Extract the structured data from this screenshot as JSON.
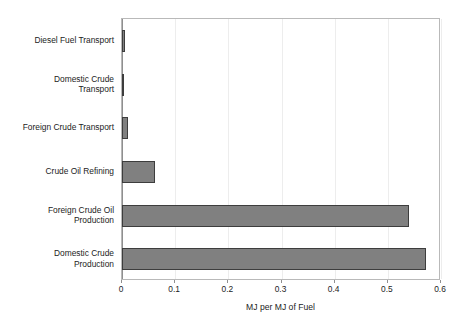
{
  "chart_data": {
    "type": "bar",
    "orientation": "horizontal",
    "title": "",
    "xlabel": "MJ per MJ of Fuel",
    "ylabel": "",
    "xlim": [
      0,
      0.6
    ],
    "xticks": [
      "0",
      "0.1",
      "0.2",
      "0.3",
      "0.4",
      "0.5",
      "0.6"
    ],
    "xtick_values": [
      0,
      0.1,
      0.2,
      0.3,
      0.4,
      0.5,
      0.6
    ],
    "grid": false,
    "legend": "none",
    "bar_color": "#808080",
    "bar_edge_color": "#3d3d3d",
    "categories": [
      "Diesel Fuel Transport",
      "Domestic Crude\nTransport",
      "Foreign Crude Transport",
      "Crude Oil Refining",
      "Foreign Crude Oil\nProduction",
      "Domestic Crude\nProduction"
    ],
    "values": [
      0.005,
      0.003,
      0.012,
      0.062,
      0.54,
      0.572
    ]
  }
}
